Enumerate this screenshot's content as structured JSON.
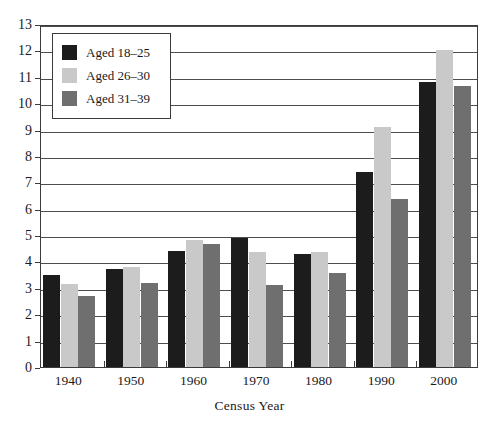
{
  "chart_data": {
    "type": "bar",
    "title": "",
    "xlabel": "Census Year",
    "ylabel": "",
    "categories": [
      "1940",
      "1950",
      "1960",
      "1970",
      "1980",
      "1990",
      "2000"
    ],
    "series": [
      {
        "name": "Aged 18–25",
        "color": "#1c1c1c",
        "values": [
          3.5,
          3.7,
          4.4,
          4.9,
          4.3,
          7.4,
          10.8
        ]
      },
      {
        "name": "Aged 26–30",
        "color": "#c9c9c9",
        "values": [
          3.15,
          3.8,
          4.8,
          4.35,
          4.35,
          9.1,
          12.0
        ]
      },
      {
        "name": "Aged 31–39",
        "color": "#6f6f6f",
        "values": [
          2.7,
          3.2,
          4.65,
          3.1,
          3.55,
          6.35,
          10.65
        ]
      }
    ],
    "ylim": [
      0,
      13
    ],
    "ytick_labels": [
      "0",
      "1",
      "2",
      "3",
      "4",
      "5",
      "6",
      "7",
      "8",
      "9",
      "10",
      "11",
      "12",
      "13"
    ],
    "ytick_values": [
      0,
      1,
      2,
      3,
      4,
      5,
      6,
      7,
      8,
      9,
      10,
      11,
      12,
      13
    ],
    "grid": true,
    "legend_position": "top-left",
    "axis_color": "#3b3b3b",
    "grid_color": "#4d4d4d",
    "background": "#ffffff"
  }
}
